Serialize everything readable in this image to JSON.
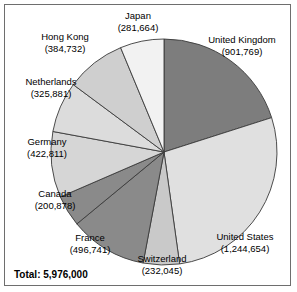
{
  "chart_data": {
    "type": "pie",
    "title": "",
    "total_label": "Total: 5,976,000",
    "total_value": 5976000,
    "categories": [
      "United Kingdom",
      "United States",
      "Switzerland",
      "France",
      "Canada",
      "Germany",
      "Netherlands",
      "Hong Kong",
      "Japan"
    ],
    "values": [
      901769,
      1244654,
      232045,
      496741,
      200878,
      422811,
      325881,
      384732,
      281664
    ],
    "value_labels": [
      "(901,769)",
      "(1,244,654)",
      "(232,045)",
      "(496,741)",
      "(200,878)",
      "(422,811)",
      "(325,881)",
      "(384,732)",
      "(281,664)"
    ],
    "slice_colors": [
      "#7d7d7d",
      "#e0e0e0",
      "#c9c9c9",
      "#8a8a8a",
      "#8a8a8a",
      "#d6d6d6",
      "#dcdcdc",
      "#cfcfcf",
      "#f2f2f2"
    ],
    "start_angle_deg": 0,
    "direction": "clockwise",
    "legend": "outside-labels",
    "grid": false,
    "slices": [
      {
        "label": "United Kingdom",
        "value_label": "(901,769)",
        "value": 901769,
        "color": "#7d7d7d"
      },
      {
        "label": "United States",
        "value_label": "(1,244,654)",
        "value": 1244654,
        "color": "#e0e0e0"
      },
      {
        "label": "Switzerland",
        "value_label": "(232,045)",
        "value": 232045,
        "color": "#c9c9c9"
      },
      {
        "label": "France",
        "value_label": "(496,741)",
        "value": 496741,
        "color": "#8a8a8a"
      },
      {
        "label": "Canada",
        "value_label": "(200,878)",
        "value": 200878,
        "color": "#8a8a8a"
      },
      {
        "label": "Germany",
        "value_label": "(422,811)",
        "value": 422811,
        "color": "#d6d6d6"
      },
      {
        "label": "Netherlands",
        "value_label": "(325,881)",
        "value": 325881,
        "color": "#dcdcdc"
      },
      {
        "label": "Hong Kong",
        "value_label": "(384,732)",
        "value": 384732,
        "color": "#cfcfcf"
      },
      {
        "label": "Japan",
        "value_label": "(281,664)",
        "value": 281664,
        "color": "#f2f2f2"
      }
    ]
  },
  "labels": {
    "japan": {
      "name": "Japan",
      "value": "(281,664)"
    },
    "hong_kong": {
      "name": "Hong Kong",
      "value": "(384,732)"
    },
    "netherlands": {
      "name": "Netherlands",
      "value": "(325,881)"
    },
    "germany": {
      "name": "Germany",
      "value": "(422,811)"
    },
    "canada": {
      "name": "Canada",
      "value": "(200,878)"
    },
    "france": {
      "name": "France",
      "value": "(496,741)"
    },
    "switzerland": {
      "name": "Switzerland",
      "value": "(232,045)"
    },
    "united_states": {
      "name": "United States",
      "value": "(1,244,654)"
    },
    "united_kingdom": {
      "name": "United Kingdom",
      "value": "(901,769)"
    }
  },
  "footer": {
    "total": "Total: 5,976,000"
  },
  "colors": {
    "border": "#6e6e6e",
    "slice_stroke": "#3a3a3a",
    "background": "#ffffff",
    "text": "#000000"
  }
}
